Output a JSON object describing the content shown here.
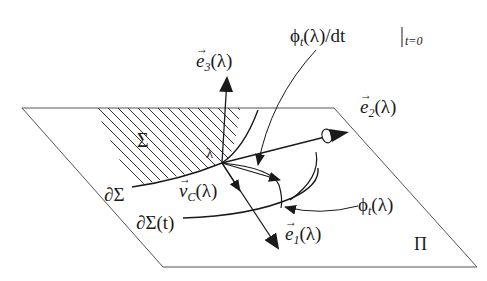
{
  "labels": {
    "e3": "e⃗₃(λ)",
    "e3_base": "e",
    "e3_sub": "3",
    "e3_arg": "(λ)",
    "e2_base": "e",
    "e2_sub": "2",
    "e2_arg": "(λ)",
    "e1_base": "e",
    "e1_sub": "1",
    "e1_arg": "(λ)",
    "vc_base": "v",
    "vc_sub": "C",
    "vc_arg": "(λ)",
    "phi_base": "ϕ",
    "phi_sub": "t",
    "phi_arg": "(λ)",
    "dphi_base": "ϕ",
    "dphi_sub": "t",
    "dphi_mid": "(λ)/dt",
    "dphi_eval": "t=0",
    "sigma": "Σ",
    "lambda": "λ",
    "dsigma": "∂Σ",
    "dsigma_t": "∂Σ(t)",
    "plane": "Π"
  },
  "colors": {
    "stroke": "#1a1a1a",
    "plane_stroke": "#555555",
    "hatch": "#333333",
    "background": "#ffffff"
  }
}
